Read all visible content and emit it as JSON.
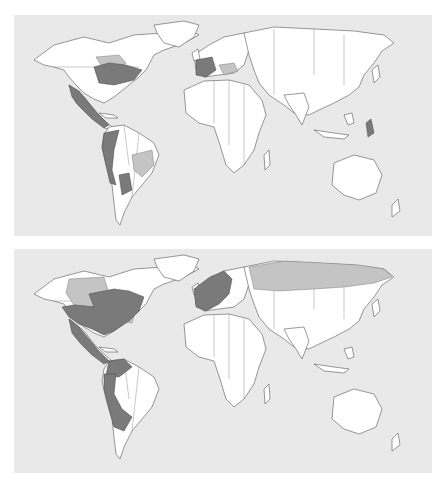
{
  "figure": {
    "type": "choropleth world maps (no text labels visible)",
    "panels": [
      {
        "id": "top",
        "dark_regions": [
          "Eastern Canada (Quebec/Ontario)",
          "Mexico",
          "Central America",
          "Colombia",
          "Ecuador",
          "Peru",
          "Bolivia",
          "Paraguay",
          "France",
          "Spain",
          "Belgium",
          "Philippines"
        ],
        "light_regions": [
          "Hudson Bay area",
          "Eastern Brazil",
          "Italy",
          "Balkans"
        ]
      },
      {
        "id": "bottom",
        "dark_regions": [
          "Eastern Canada",
          "Eastern & Central USA",
          "Mexico",
          "Central America",
          "Cuba",
          "Venezuela",
          "Colombia",
          "Ecuador",
          "Peru",
          "Bolivia",
          "Paraguay",
          "Argentina (north)",
          "United Kingdom",
          "France",
          "Spain",
          "Scandinavia",
          "Central Europe"
        ],
        "light_regions": [
          "Western Canada",
          "US Atlantic coast",
          "Russia"
        ]
      }
    ],
    "colors": {
      "ocean": "#e9e9e9",
      "land": "#ffffff",
      "dark": "#7a7a7a",
      "light": "#c4c4c4",
      "outline": "#555555"
    }
  }
}
